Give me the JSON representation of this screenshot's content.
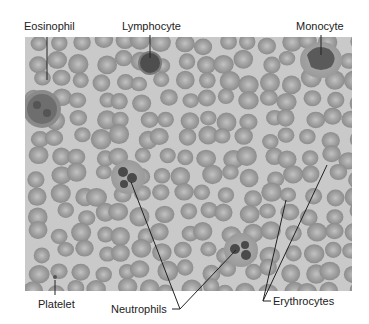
{
  "figure": {
    "labels": {
      "eosinophil": "Eosinophil",
      "lymphocyte": "Lymphocyte",
      "monocyte": "Monocyte",
      "platelet": "Platelet",
      "neutrophils": "Neutrophils",
      "erythrocytes": "Erythrocytes"
    },
    "colors": {
      "background": "#c9c9c9",
      "rbc": "#9a9a9a",
      "rbc_center": "#b8b8b8",
      "nucleus": "#4a4a4a",
      "leader_line": "#222222"
    }
  }
}
